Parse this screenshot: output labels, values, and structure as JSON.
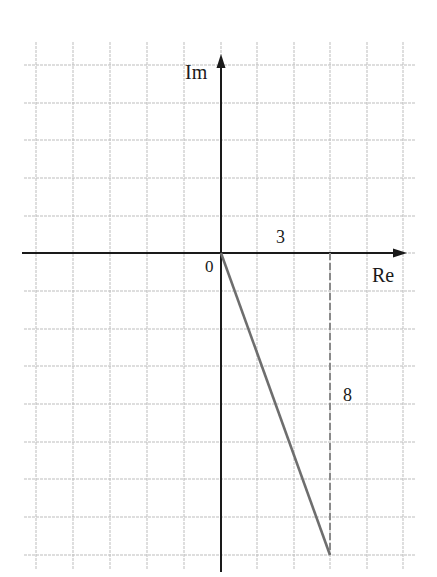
{
  "diagram": {
    "type": "complex-plane",
    "title": "",
    "axes": {
      "x_label": "Re",
      "y_label": "Im",
      "origin_label": "0"
    },
    "grid": {
      "cell_px": 37,
      "origin_px": [
        221,
        253
      ],
      "x_range_cells": [
        -5,
        5
      ],
      "y_range_cells": [
        -8,
        5
      ]
    },
    "point": {
      "re": 3,
      "im": -8,
      "expression": "3 - 8i"
    },
    "annotations": {
      "real_part_label": "3",
      "imag_part_label": "8"
    },
    "colors": {
      "grid": "#b8b8b8",
      "axis": "#1a1a1a",
      "vector": "#6e6e6e",
      "dashed": "#8a8a8a",
      "text": "#1a1a1a"
    }
  },
  "chart_data": {
    "type": "scatter",
    "title": "",
    "xlabel": "Re",
    "ylabel": "Im",
    "x": [
      0,
      3
    ],
    "y": [
      0,
      -8
    ],
    "series": [
      {
        "name": "vector z",
        "values": [
          [
            0,
            0
          ],
          [
            3,
            -8
          ]
        ]
      },
      {
        "name": "imaginary projection (dashed)",
        "values": [
          [
            3,
            0
          ],
          [
            3,
            -8
          ]
        ]
      }
    ],
    "annotations": [
      {
        "text": "3",
        "at": [
          1.5,
          0.5
        ]
      },
      {
        "text": "8",
        "at": [
          3.5,
          -4
        ]
      },
      {
        "text": "0",
        "at": [
          0,
          0
        ]
      }
    ],
    "xlim": [
      -5,
      5
    ],
    "ylim": [
      -8,
      5
    ],
    "grid": true
  }
}
